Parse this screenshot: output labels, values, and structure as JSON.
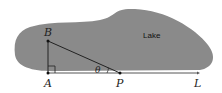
{
  "diagram": {
    "region_label": "Lake",
    "points": {
      "A": "A",
      "B": "B",
      "P": "P",
      "L": "L"
    },
    "angle_label": "θ",
    "colors": {
      "lake_fill": "#8a8a8a",
      "line": "#222222",
      "background": "#ffffff"
    }
  }
}
